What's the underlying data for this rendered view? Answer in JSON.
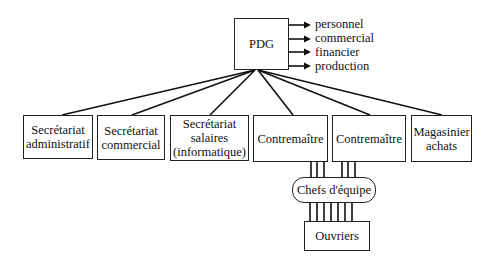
{
  "diagram": {
    "top": {
      "label": "PDG"
    },
    "functions": [
      "personnel",
      "commercial",
      "financier",
      "production"
    ],
    "departments": [
      {
        "label": "Secrétariat administratif"
      },
      {
        "label": "Secrétariat commercial"
      },
      {
        "label": "Secrétariat salaires (informatique)"
      },
      {
        "label": "Contremaître"
      },
      {
        "label": "Contremaître"
      },
      {
        "label": "Magasinier achats"
      }
    ],
    "team_leads": {
      "label": "Chefs d'équipe"
    },
    "workers": {
      "label": "Ouvriers"
    }
  }
}
